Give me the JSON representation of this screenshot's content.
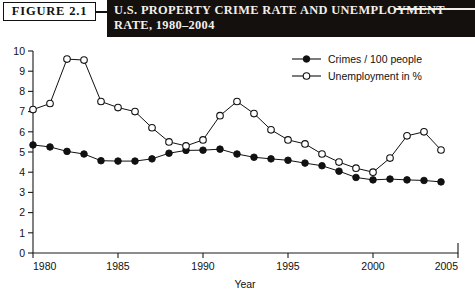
{
  "header": {
    "figure_tag": "FIGURE   2.1",
    "title_line_1": "U.S. PROPERTY CRIME RATE AND UNEMPLOYMENT",
    "title_line_2": "RATE, 1980–2004",
    "banner_color": "#14100e",
    "banner_text_color": "#f2efe9"
  },
  "chart_data": {
    "type": "line",
    "title": "U.S. PROPERTY CRIME RATE AND UNEMPLOYMENT RATE, 1980–2004",
    "xlabel": "Year",
    "ylabel": "",
    "xlim": [
      1980,
      2005
    ],
    "ylim": [
      0,
      10
    ],
    "xticks": [
      1980,
      1985,
      1990,
      1995,
      2000,
      2005
    ],
    "xtick_labels": [
      "1980",
      "1985",
      "1990",
      "1995",
      "2000",
      "2005"
    ],
    "yticks": [
      0,
      1,
      2,
      3,
      4,
      5,
      6,
      7,
      8,
      9,
      10
    ],
    "ytick_labels": [
      "0",
      "1",
      "2",
      "3",
      "4",
      "5",
      "6",
      "7",
      "8",
      "9",
      "10"
    ],
    "grid": false,
    "legend_position": "top-right",
    "x": [
      1980,
      1981,
      1982,
      1983,
      1984,
      1985,
      1986,
      1987,
      1988,
      1989,
      1990,
      1991,
      1992,
      1993,
      1994,
      1995,
      1996,
      1997,
      1998,
      1999,
      2000,
      2001,
      2002,
      2003,
      2004
    ],
    "series": [
      {
        "name": "Crimes / 100 people",
        "marker": "filled-circle",
        "color": "#111111",
        "values": [
          5.35,
          5.25,
          5.03,
          4.9,
          4.57,
          4.55,
          4.55,
          4.66,
          4.94,
          5.08,
          5.09,
          5.14,
          4.9,
          4.74,
          4.66,
          4.59,
          4.45,
          4.32,
          4.05,
          3.74,
          3.62,
          3.66,
          3.62,
          3.59,
          3.52
        ]
      },
      {
        "name": "Unemployment in %",
        "marker": "open-circle",
        "color": "#111111",
        "values": [
          7.1,
          7.4,
          9.6,
          9.55,
          7.5,
          7.2,
          7.0,
          6.2,
          5.5,
          5.3,
          5.6,
          6.8,
          7.5,
          6.9,
          6.1,
          5.6,
          5.4,
          4.9,
          4.5,
          4.2,
          4.0,
          4.7,
          5.8,
          6.0,
          5.1
        ]
      }
    ]
  }
}
